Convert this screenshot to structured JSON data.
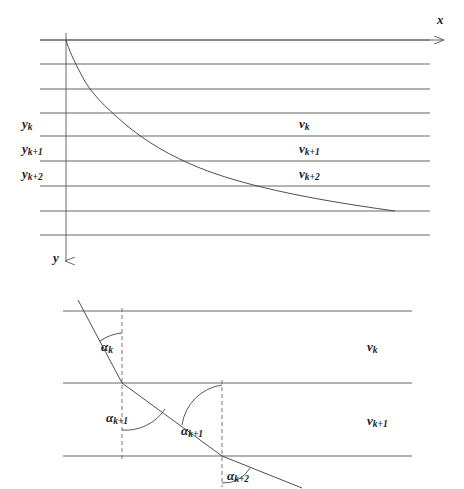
{
  "figure": {
    "background_color": "#ffffff",
    "line_color": "#555555",
    "curve_color": "#3a3a3a",
    "text_color": "#1c1c1c",
    "width": 464,
    "height": 489
  },
  "top_panel": {
    "axis_x_label": "x",
    "axis_y_label": "y",
    "depth_labels": [
      {
        "base": "y",
        "sub": "k"
      },
      {
        "base": "y",
        "sub": "k+1"
      },
      {
        "base": "y",
        "sub": "k+2"
      }
    ],
    "velocity_labels": [
      {
        "base": "v",
        "sub": "k"
      },
      {
        "base": "v",
        "sub": "k+1"
      },
      {
        "base": "v",
        "sub": "k+2"
      }
    ],
    "layer_line_y": [
      40,
      64,
      89,
      113,
      136,
      161,
      186,
      211,
      235
    ],
    "curve_points": [
      [
        66,
        40
      ],
      [
        70,
        52
      ],
      [
        75,
        64
      ],
      [
        82,
        76
      ],
      [
        90,
        89
      ],
      [
        100,
        101
      ],
      [
        112,
        113
      ],
      [
        125,
        124
      ],
      [
        140,
        136
      ],
      [
        162,
        148
      ],
      [
        186,
        161
      ],
      [
        222,
        173
      ],
      [
        262,
        186
      ],
      [
        315,
        198
      ],
      [
        395,
        211
      ]
    ],
    "x_axis_arrow_end": 449,
    "y_axis_arrow_end": 270
  },
  "bottom_panel": {
    "interface_line_y": [
      311,
      383,
      456
    ],
    "velocity_labels": [
      {
        "base": "v",
        "sub": "k"
      },
      {
        "base": "v",
        "sub": "k+1"
      }
    ],
    "angle_labels": [
      {
        "base": "α",
        "sub": "k"
      },
      {
        "base": "α",
        "sub": "k+1"
      },
      {
        "base": "α",
        "sub": "k+1"
      },
      {
        "base": "α",
        "sub": "k+2"
      }
    ],
    "normal_dashed_x": [
      122,
      222
    ],
    "ray_vertices": [
      [
        78,
        300
      ],
      [
        122,
        383
      ],
      [
        222,
        456
      ],
      [
        300,
        487
      ]
    ]
  }
}
